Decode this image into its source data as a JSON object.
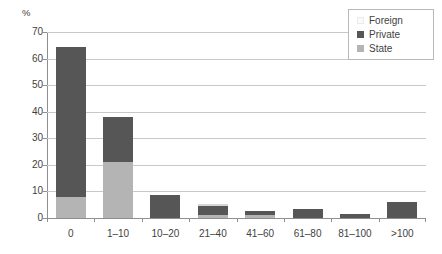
{
  "chart_data": {
    "type": "bar",
    "title": "",
    "subtitle": "",
    "xlabel": "",
    "ylabel": "%",
    "ylim": [
      0,
      70
    ],
    "ytick_step": 10,
    "grid": true,
    "stacked": true,
    "legend_position": "top-right",
    "categories": [
      "0",
      "1–10",
      "10–20",
      "21–40",
      "41–60",
      "61–80",
      "81–100",
      ">100"
    ],
    "yticks": [
      "0",
      "10",
      "20",
      "30",
      "40",
      "50",
      "60",
      "70"
    ],
    "series": [
      {
        "name": "State",
        "color": "#b4b4b4",
        "values": [
          8,
          21,
          0,
          1,
          1,
          0,
          0,
          0
        ]
      },
      {
        "name": "Private",
        "color": "#565656",
        "values": [
          56.5,
          17,
          8.5,
          3.5,
          1.5,
          3.5,
          1.5,
          6
        ]
      },
      {
        "name": "Foreign",
        "color": "#f2f2f2",
        "values": [
          0,
          0,
          0,
          0.5,
          0,
          0,
          0,
          0
        ]
      }
    ],
    "totals": [
      64.5,
      38,
      8.5,
      5,
      2.5,
      3.5,
      1.5,
      6
    ],
    "annotations": []
  },
  "legend": {
    "entries": [
      {
        "label": "Foreign",
        "swatch": "foreign"
      },
      {
        "label": "Private",
        "swatch": "private"
      },
      {
        "label": "State",
        "swatch": "state"
      }
    ]
  },
  "colors": {
    "private": "#565656",
    "state": "#b4b4b4",
    "foreign": "#f2f2f2",
    "gridline": "#c8c8c8",
    "axis": "#8f8f8f",
    "text": "#3f3f3f",
    "background": "#ffffff"
  }
}
